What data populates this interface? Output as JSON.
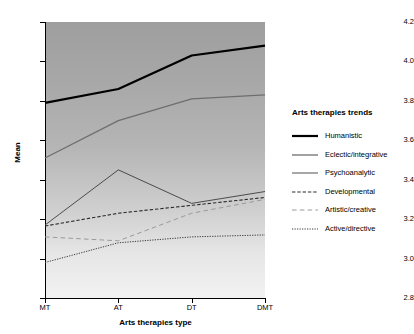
{
  "chart_data": {
    "type": "line",
    "title": "",
    "xlabel": "Arts therapies type",
    "ylabel": "Mean",
    "categories": [
      "MT",
      "AT",
      "DT",
      "DMT"
    ],
    "ylim": [
      2.8,
      4.2
    ],
    "yticks": [
      "2.8",
      "3.0",
      "3.2",
      "3.4",
      "3.6",
      "3.8",
      "4.0",
      "4.2"
    ],
    "grid": false,
    "legend_position": "right",
    "legend_title": "Arts therapies trends",
    "series": [
      {
        "name": "Humanistic",
        "values": [
          3.79,
          3.86,
          4.03,
          4.08
        ],
        "style": "solid",
        "color": "#000000",
        "width": 2.2
      },
      {
        "name": "Eclectic/integrative",
        "values": [
          3.51,
          3.7,
          3.81,
          3.83
        ],
        "style": "solid",
        "color": "#6e6e6e",
        "width": 1.3
      },
      {
        "name": "Psychoanalytic",
        "values": [
          3.17,
          3.45,
          3.28,
          3.34
        ],
        "style": "solid",
        "color": "#3c3c3c",
        "width": 0.9
      },
      {
        "name": "Developmental",
        "values": [
          3.165,
          3.23,
          3.27,
          3.31
        ],
        "style": "dashed",
        "color": "#2b2b2b",
        "width": 1.1
      },
      {
        "name": "Artistic/creative",
        "values": [
          3.11,
          3.09,
          3.23,
          3.3
        ],
        "style": "longdash",
        "color": "#9a9a9a",
        "width": 1.0
      },
      {
        "name": "Active/directive",
        "values": [
          2.98,
          3.08,
          3.11,
          3.12
        ],
        "style": "dotted",
        "color": "#3c3c3c",
        "width": 1.0
      }
    ]
  }
}
